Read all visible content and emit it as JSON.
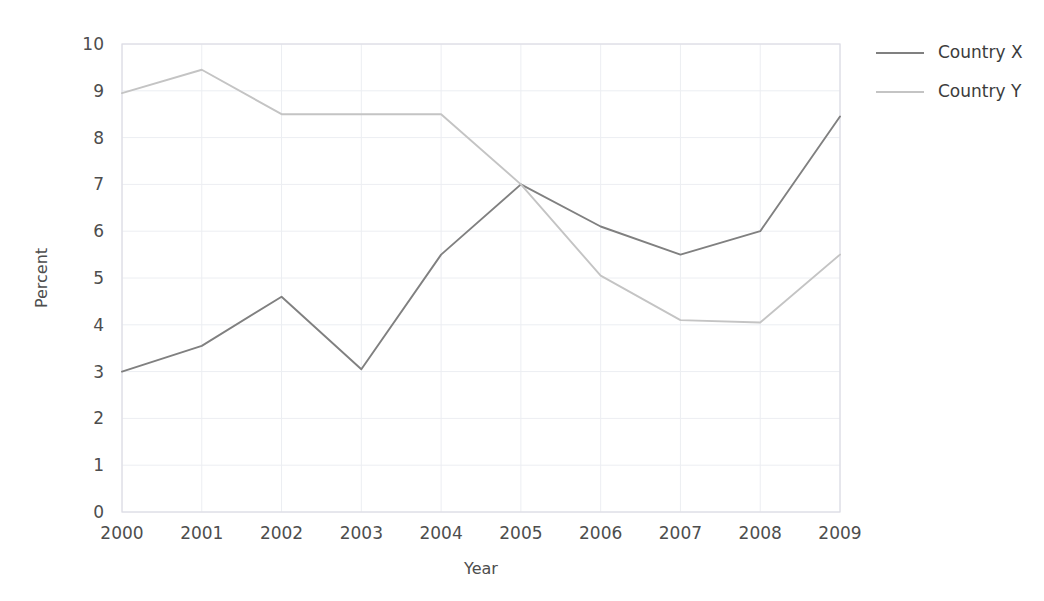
{
  "chart_data": {
    "type": "line",
    "title": "",
    "subtitle": "",
    "xlabel": "Year",
    "ylabel": "Percent",
    "categories": [
      "2000",
      "2001",
      "2002",
      "2003",
      "2004",
      "2005",
      "2006",
      "2007",
      "2008",
      "2009"
    ],
    "x": [
      2000,
      2001,
      2002,
      2003,
      2004,
      2005,
      2006,
      2007,
      2008,
      2009
    ],
    "series": [
      {
        "name": "Country X",
        "color": "#808080",
        "values": [
          3.0,
          3.55,
          4.6,
          3.05,
          5.5,
          7.0,
          6.1,
          5.5,
          6.0,
          8.45
        ]
      },
      {
        "name": "Country Y",
        "color": "#c4c4c4",
        "values": [
          8.95,
          9.45,
          8.5,
          8.5,
          8.5,
          7.0,
          5.05,
          4.1,
          4.05,
          5.5
        ]
      }
    ],
    "ylim": [
      0,
      10
    ],
    "yticks": [
      0,
      1,
      2,
      3,
      4,
      5,
      6,
      7,
      8,
      9,
      10
    ],
    "ytick_labels": [
      "0",
      "1",
      "2",
      "3",
      "4",
      "5",
      "6",
      "7",
      "8",
      "9",
      "10"
    ],
    "xlim": [
      2000,
      2009
    ],
    "grid": true,
    "grid_color": "#eceef2",
    "legend_position": "right",
    "background": "#ffffff"
  },
  "legend": {
    "entries": [
      {
        "label": "Country X"
      },
      {
        "label": "Country Y"
      }
    ]
  },
  "axes": {
    "y_label": "Percent",
    "x_label": "Year"
  }
}
